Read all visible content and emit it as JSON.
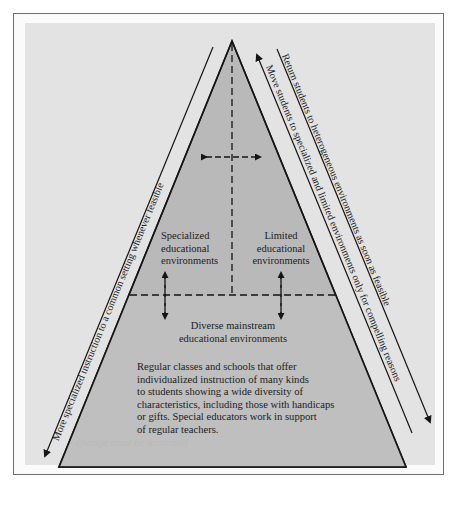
{
  "diagram": {
    "type": "pyramid",
    "colors": {
      "frame_border": "#6f6f6f",
      "panel_background": "#e3e3e3",
      "pyramid_fill": "#b9b9b9",
      "line": "#151515"
    },
    "regions": {
      "specialized": {
        "line1": "Specialized",
        "line2": "educational",
        "line3": "environments"
      },
      "limited": {
        "line1": "Limited",
        "line2": "educational",
        "line3": "environments"
      },
      "mainstream": {
        "line1": "Diverse mainstream",
        "line2": "educational environments"
      },
      "description": {
        "lines": [
          "Regular classes and schools that offer",
          "individualized instruction of many kinds",
          "to students showing a wide diversity of",
          "characteristics, including those with handicaps",
          "or gifts.  Special educators work in support",
          "of regular teachers."
        ]
      },
      "bleed_through_text": "change must be launched"
    },
    "side_arrows": {
      "left": "More specialized instruction to a common setting whenever feasible",
      "right_outer": "Return students to heterogeneous environments as soon as feasible",
      "right_inner": "Move students to specialized and limited environments only for compelling reasons"
    },
    "icons": {
      "left_arrow_head": "arrow-down-left",
      "right_outer_arrow_head": "arrow-down-right",
      "right_inner_arrow_head": "arrow-up-left",
      "center_horizontal_arrow": "double-arrow-horizontal",
      "vertical_arrows": "double-arrow-vertical"
    }
  }
}
